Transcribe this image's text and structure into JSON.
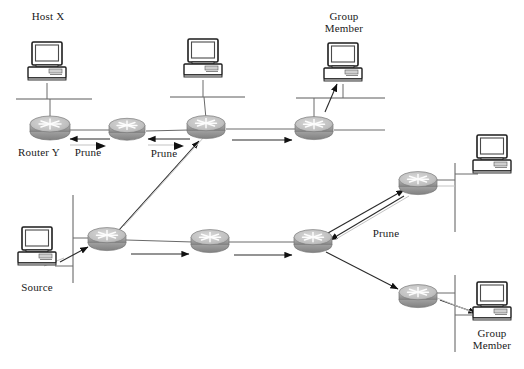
{
  "figure": {
    "type": "network-diagram",
    "width": 524,
    "height": 369,
    "background_color": "#ffffff",
    "line_color": "#3c3c3c",
    "faint_line_color": "#b4b4b4",
    "router_body_color": "#9e9e9e",
    "router_top_color": "#c6c6c6",
    "pc_color": "#f2f2f2",
    "text_color": "#1a1a1a"
  },
  "labels": {
    "host_x": "Host X",
    "router_y": "Router Y",
    "prune_1": "Prune",
    "prune_2": "Prune",
    "prune_3": "Prune",
    "group_member_top_line1": "Group",
    "group_member_top_line2": "Member",
    "group_member_bottom_line1": "Group",
    "group_member_bottom_line2": "Member",
    "source": "Source"
  },
  "nodes": {
    "routers": [
      {
        "id": "router-y",
        "label": "Router Y",
        "x": 50,
        "y": 127,
        "row": "top"
      },
      {
        "id": "router-top-2",
        "label": "",
        "x": 127,
        "y": 128,
        "row": "top"
      },
      {
        "id": "router-top-3",
        "label": "",
        "x": 206,
        "y": 126,
        "row": "top"
      },
      {
        "id": "router-top-4",
        "label": "",
        "x": 314,
        "y": 127,
        "row": "top"
      },
      {
        "id": "router-bottom-1",
        "label": "",
        "x": 107,
        "y": 238,
        "row": "bottom"
      },
      {
        "id": "router-bottom-2",
        "label": "",
        "x": 210,
        "y": 240,
        "row": "bottom"
      },
      {
        "id": "router-bottom-3",
        "label": "",
        "x": 313,
        "y": 240,
        "row": "bottom"
      },
      {
        "id": "router-right-up",
        "label": "",
        "x": 418,
        "y": 182,
        "row": "right"
      },
      {
        "id": "router-right-down",
        "label": "",
        "x": 418,
        "y": 295,
        "row": "right"
      }
    ],
    "computers": [
      {
        "id": "pc-host-x",
        "label": "Host X",
        "x": 47,
        "y": 65
      },
      {
        "id": "pc-top-middle",
        "label": "",
        "x": 203,
        "y": 62
      },
      {
        "id": "pc-group-member-top",
        "label": "Group Member",
        "x": 343,
        "y": 65
      },
      {
        "id": "pc-right-middle",
        "label": "",
        "x": 492,
        "y": 158
      },
      {
        "id": "pc-source",
        "label": "Source",
        "x": 37,
        "y": 250
      },
      {
        "id": "pc-group-member-bottom",
        "label": "Group Member",
        "x": 492,
        "y": 305
      }
    ]
  },
  "flows": {
    "prune_arrows": [
      {
        "from": "router-top-2",
        "to": "router-y",
        "label": "Prune"
      },
      {
        "from": "router-top-3",
        "to": "router-top-2",
        "label": "Prune"
      },
      {
        "from": "router-right-up",
        "to": "router-bottom-3",
        "label": "Prune"
      }
    ],
    "data_arrows": [
      {
        "from": "pc-source",
        "to": "router-bottom-1"
      },
      {
        "from": "router-bottom-1",
        "to": "router-bottom-2"
      },
      {
        "from": "router-bottom-2",
        "to": "router-bottom-3"
      },
      {
        "from": "router-bottom-1",
        "to": "router-top-3"
      },
      {
        "from": "router-top-3",
        "to": "router-top-4"
      },
      {
        "from": "router-top-4",
        "to": "pc-group-member-top"
      },
      {
        "from": "router-bottom-3",
        "to": "router-right-up"
      },
      {
        "from": "router-bottom-3",
        "to": "router-right-down"
      },
      {
        "from": "router-right-down",
        "to": "pc-group-member-bottom"
      }
    ]
  }
}
